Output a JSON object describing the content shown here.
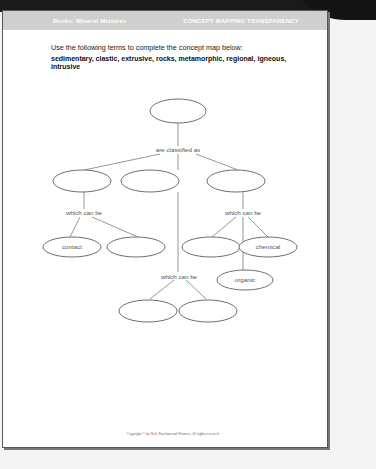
{
  "header": {
    "left_title": "Rocks: Mineral Mixtures",
    "right_title": "CONCEPT MAPPING TRANSPARENCY"
  },
  "instructions": {
    "prompt": "Use the following terms to complete the concept map below:",
    "terms": "sedimentary, clastic, extrusive, rocks, metamorphic, regional, igneous, intrusive"
  },
  "concept_map": {
    "nodes": [
      {
        "id": "root",
        "label": ""
      },
      {
        "id": "l2-a",
        "label": ""
      },
      {
        "id": "l2-b",
        "label": ""
      },
      {
        "id": "l2-c",
        "label": ""
      },
      {
        "id": "l3-a",
        "label": "contact"
      },
      {
        "id": "l3-b",
        "label": ""
      },
      {
        "id": "l3-c",
        "label": ""
      },
      {
        "id": "l3-d",
        "label": "chemical"
      },
      {
        "id": "l3-e",
        "label": "organic"
      },
      {
        "id": "l4-a",
        "label": ""
      },
      {
        "id": "l4-b",
        "label": ""
      }
    ],
    "links": {
      "root": "are classified as",
      "left": "which can be",
      "middle": "which can be",
      "right": "which can be"
    }
  },
  "footer": {
    "copyright": "Copyright © by Holt, Rinehart and Winston. All rights reserved."
  }
}
